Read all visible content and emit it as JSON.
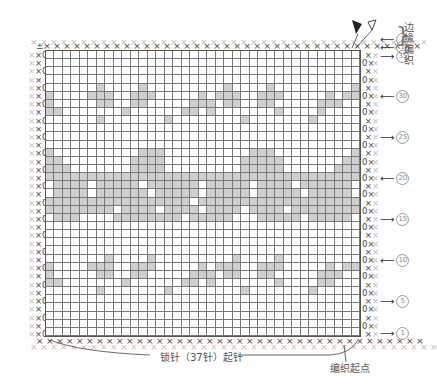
{
  "chart_data": {
    "type": "table",
    "columns": 37,
    "rows": 35,
    "cast_on_label": "锁针（37针）起针",
    "start_label": "编织起点",
    "edge_label": "边缘编织",
    "row_markers": [
      {
        "label": "②",
        "row": "edge2",
        "direction": "left"
      },
      {
        "label": "①",
        "row": "edge1",
        "direction": "left"
      },
      {
        "label": "35",
        "row": 35,
        "direction": "right"
      },
      {
        "label": "30",
        "row": 30,
        "direction": "left"
      },
      {
        "label": "25",
        "row": 25,
        "direction": "right"
      },
      {
        "label": "20",
        "row": 20,
        "direction": "left"
      },
      {
        "label": "15",
        "row": 15,
        "direction": "right"
      },
      {
        "label": "10",
        "row": 10,
        "direction": "left"
      },
      {
        "label": "5",
        "row": 5,
        "direction": "right"
      },
      {
        "label": "1",
        "row": 1,
        "direction": "right"
      }
    ],
    "shaded_rows_top_to_bottom": [
      ".....................................",
      ".....................................",
      ".....................................",
      ".....................................",
      "......x....x.........x....x.........x",
      "x....xxx..xxx.....x.xxx..xxx.....x.xx",
      "x.....xx..xx.....xxx.xx..xx.....xxx..",
      "xx.......x......xx.x.......x....x....",
      "......x.......x........x.......x.....",
      ".....................................",
      ".....................................",
      ".....................................",
      "x..........xxx..........xxx.........x",
      "xx........xxxx.........xxxxx.......xx",
      "xxx.......xxxx.........xxxxx......xxx",
      "xxxxxxxxxxxxxxxxxxxxxxxxxxxxxxxxxxxxx",
      ".xxxx.xxxxx.xxxxxx.xxxxx.xxxx.xxxxxx.",
      ".xxxx.xxxxxx.xxxxx.xxxxx.xxxxx.xxxxx.",
      "xxxxxxxxxxxxxxxxx.xxxxxxxxxxxxxxxxxxx",
      "xxxxxxxx.xxxx.xxxx.xxxx.xxxx.xxxxxxxx",
      ".xxx....xxxxxxxx.xxxxx...xxxxx.xxxxx.",
      ".....................................",
      ".....................................",
      ".....................................",
      ".....................................",
      ".......x....x.........x....x.........",
      "x....xxx..xxx.....x.xxx..xxx.....x.xx",
      "x.....xx..xx.....xxx.xx..xx.....xxx..",
      "xx.......x......xx.x.......x....xx...",
      "......x.......x........x.......x.....",
      ".....................................",
      ".....................................",
      ".....................................",
      ".....................................",
      "....................................."
    ],
    "shade_color": "#cfcfcf",
    "grid_color": "#777777"
  },
  "labels": {
    "edge_title_chars": [
      "边",
      "缘",
      "编",
      "织"
    ],
    "cast_on": "锁针（37针）起针",
    "start": "编织起点",
    "markers": {
      "m2": "2",
      "m1top": "1",
      "m35": "35",
      "m30": "30",
      "m25": "25",
      "m20": "20",
      "m15": "15",
      "m10": "10",
      "m5": "5",
      "m1": "1"
    }
  }
}
